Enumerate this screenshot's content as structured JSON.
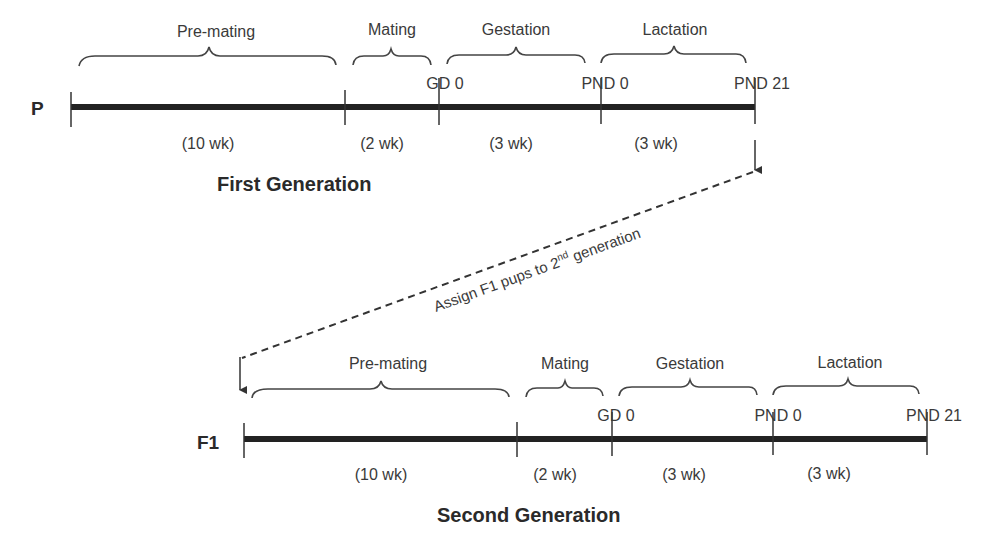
{
  "diagram": {
    "generations": [
      {
        "row_label": "P",
        "title": "First Generation",
        "phases": [
          {
            "label": "Pre-mating",
            "duration": "(10 wk)"
          },
          {
            "label": "Mating",
            "duration": "(2 wk)"
          },
          {
            "label": "Gestation",
            "duration": "(3 wk)"
          },
          {
            "label": "Lactation",
            "duration": "(3 wk)"
          }
        ],
        "markers": [
          "GD 0",
          "PND 0",
          "PND 21"
        ]
      },
      {
        "row_label": "F1",
        "title": "Second Generation",
        "phases": [
          {
            "label": "Pre-mating",
            "duration": "(10 wk)"
          },
          {
            "label": "Mating",
            "duration": "(2 wk)"
          },
          {
            "label": "Gestation",
            "duration": "(3 wk)"
          },
          {
            "label": "Lactation",
            "duration": "(3 wk)"
          }
        ],
        "markers": [
          "GD 0",
          "PND 0",
          "PND 21"
        ]
      }
    ],
    "transfer_arrow": {
      "label_main": "Assign F1 pups to 2",
      "label_sup": "nd",
      "label_end": " generation"
    }
  }
}
